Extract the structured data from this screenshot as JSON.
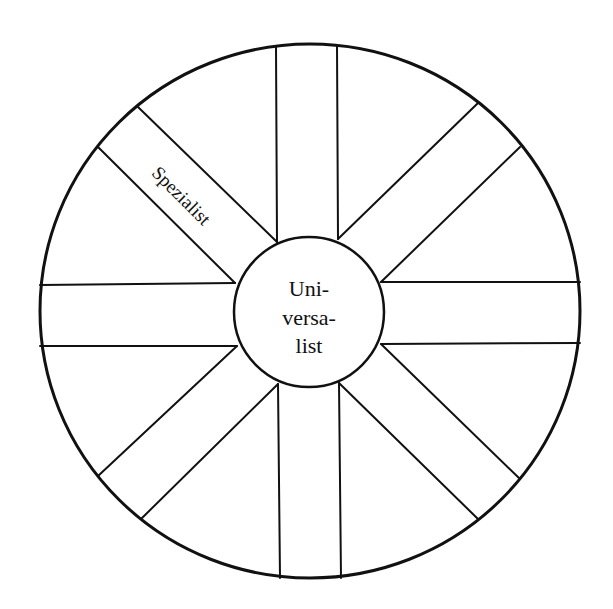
{
  "diagram": {
    "type": "wheel",
    "colors": {
      "stroke": "#111111",
      "background": "#ffffff"
    },
    "outer_circle": {
      "cx": 310,
      "cy": 311,
      "rx": 270,
      "ry": 267
    },
    "inner_circle": {
      "cx": 309,
      "cy": 312,
      "r": 75
    },
    "center_label": {
      "lines": [
        "Uni-",
        "versa-",
        "list"
      ]
    },
    "spokes": [
      {
        "id": "top",
        "lines": [
          [
            277,
            242,
            276,
            47
          ],
          [
            338,
            239,
            337,
            45
          ]
        ]
      },
      {
        "id": "top-right",
        "lines": [
          [
            338,
            239,
            478,
            103
          ],
          [
            381,
            282,
            520,
            147
          ]
        ]
      },
      {
        "id": "right",
        "lines": [
          [
            381,
            282,
            580,
            282
          ],
          [
            381,
            344,
            580,
            343
          ]
        ]
      },
      {
        "id": "bottom-right",
        "lines": [
          [
            381,
            344,
            520,
            479
          ],
          [
            339,
            383,
            478,
            519
          ]
        ]
      },
      {
        "id": "bottom",
        "lines": [
          [
            339,
            383,
            341,
            578
          ],
          [
            278,
            384,
            280,
            578
          ]
        ]
      },
      {
        "id": "bottom-left",
        "lines": [
          [
            278,
            384,
            141,
            519
          ],
          [
            237,
            346,
            98,
            476
          ]
        ]
      },
      {
        "id": "left",
        "lines": [
          [
            237,
            346,
            40,
            346
          ],
          [
            235,
            283,
            40,
            285
          ]
        ]
      },
      {
        "id": "top-left",
        "lines": [
          [
            235,
            283,
            98,
            147
          ],
          [
            277,
            242,
            138,
            107
          ]
        ]
      }
    ],
    "spoke_labels": [
      {
        "spoke": "top-left",
        "text": "Spezialist"
      }
    ]
  }
}
